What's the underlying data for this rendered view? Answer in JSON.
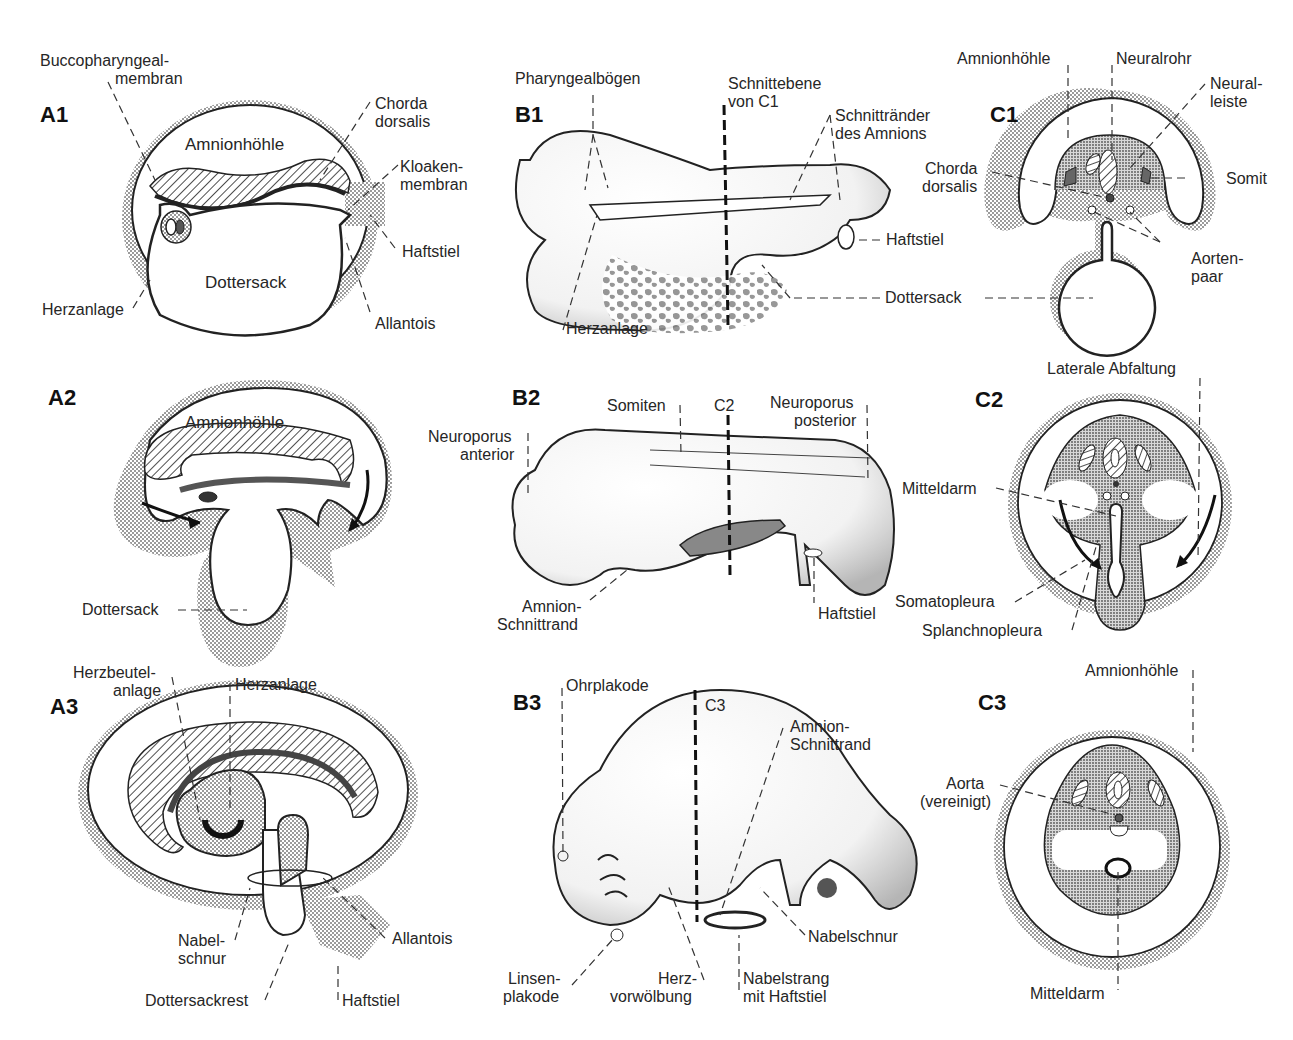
{
  "figure": {
    "panels": {
      "A1": {
        "id": "A1",
        "labels": {
          "buccopharyngeal": "Buccopharyngeal-\nmembran",
          "buccopharyngeal_l1": "Buccopharyngeal-",
          "buccopharyngeal_l2": "membran",
          "amnion": "Amnionhöhle",
          "chorda_l1": "Chorda",
          "chorda_l2": "dorsalis",
          "kloaken_l1": "Kloaken-",
          "kloaken_l2": "membran",
          "haftstiel": "Haftstiel",
          "dottersack": "Dottersack",
          "herzanlage": "Herzanlage",
          "allantois": "Allantois"
        }
      },
      "B1": {
        "id": "B1",
        "labels": {
          "pharyngeal": "Pharyngealbögen",
          "schnittebene_l1": "Schnittebene",
          "schnittebene_l2": "von C1",
          "schnittraender_l1": "Schnittränder",
          "schnittraender_l2": "des Amnions",
          "haftstiel": "Haftstiel",
          "dottersack": "Dottersack",
          "herzanlage": "Herzanlage"
        }
      },
      "C1": {
        "id": "C1",
        "labels": {
          "amnion": "Amnionhöhle",
          "neuralrohr": "Neuralrohr",
          "neuralleiste_l1": "Neural-",
          "neuralleiste_l2": "leiste",
          "chorda_l1": "Chorda",
          "chorda_l2": "dorsalis",
          "somit": "Somit",
          "aorten_l1": "Aorten-",
          "aorten_l2": "paar"
        }
      },
      "A2": {
        "id": "A2",
        "labels": {
          "amnion": "Amnionhöhle",
          "dottersack": "Dottersack"
        }
      },
      "B2": {
        "id": "B2",
        "labels": {
          "somiten": "Somiten",
          "c2": "C2",
          "np_posterior_l1": "Neuroporus",
          "np_posterior_l2": "posterior",
          "np_anterior_l1": "Neuroporus",
          "np_anterior_l2": "anterior",
          "amnion_l1": "Amnion-",
          "amnion_l2": "Schnittrand",
          "haftstiel": "Haftstiel"
        }
      },
      "C2": {
        "id": "C2",
        "labels": {
          "laterale": "Laterale Abfaltung",
          "mitteldarm": "Mitteldarm",
          "somatopleura": "Somatopleura",
          "splanchnopleura": "Splanchnopleura"
        }
      },
      "A3": {
        "id": "A3",
        "labels": {
          "herzbeutel_l1": "Herzbeutel-",
          "herzbeutel_l2": "anlage",
          "herzanlage": "Herzanlage",
          "nabel_l1": "Nabel-",
          "nabel_l2": "schnur",
          "allantois": "Allantois",
          "dottersackrest": "Dottersackrest",
          "haftstiel": "Haftstiel"
        }
      },
      "B3": {
        "id": "B3",
        "labels": {
          "ohrplakode": "Ohrplakode",
          "c3": "C3",
          "amnion_l1": "Amnion-",
          "amnion_l2": "Schnittrand",
          "nabelschnur": "Nabelschnur",
          "linsen_l1": "Linsen-",
          "linsen_l2": "plakode",
          "herz_l1": "Herz-",
          "herz_l2": "vorwölbung",
          "nabelstrang_l1": "Nabelstrang",
          "nabelstrang_l2": "mit Haftstiel"
        }
      },
      "C3": {
        "id": "C3",
        "labels": {
          "amnion": "Amnionhöhle",
          "aorta_l1": "Aorta",
          "aorta_l2": "(vereinigt)",
          "mitteldarm": "Mitteldarm"
        }
      }
    },
    "colors": {
      "ink": "#1a1a1a",
      "stipple": "#9a9a9a",
      "stipple_dark": "#6e6e6e",
      "background": "#ffffff"
    }
  }
}
